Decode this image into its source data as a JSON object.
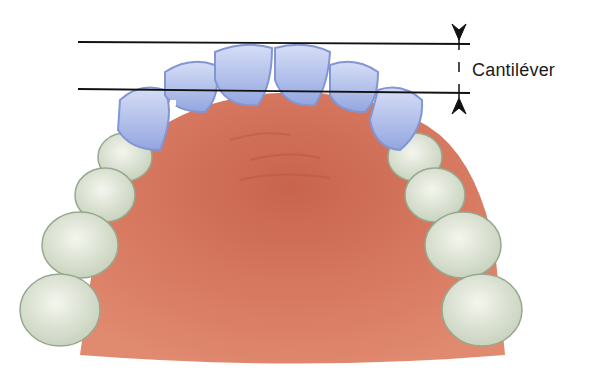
{
  "diagram": {
    "type": "dental illustration - maxillary arch occlusal view",
    "annotation": {
      "label": "Cantiléver"
    },
    "colors": {
      "palate": "#d9775f",
      "palate_dark": "#c65f4a",
      "abutment_teeth": "#a9b8e8",
      "abutment_outline": "#7f90cf",
      "natural_teeth": "#dfe6d6",
      "natural_outline": "#9aa892",
      "lines": "#111111",
      "background": "#ffffff"
    },
    "teeth": {
      "anterior_highlighted": 8,
      "posterior_left": 4,
      "posterior_right": 4
    }
  }
}
